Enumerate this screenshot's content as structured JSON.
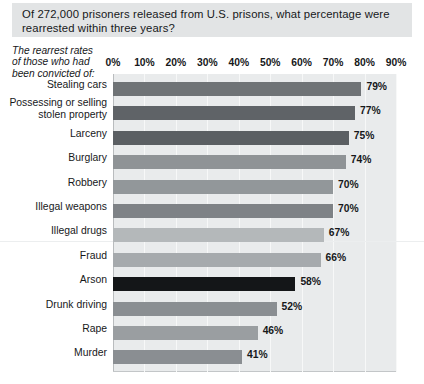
{
  "title": {
    "text": "Of 272,000 prisoners released from U.S. prisons, what percentage were\nrearrested within three years?"
  },
  "subtitle": {
    "text": "The rearrest rates\nof those who had\nbeen convicted of:"
  },
  "chart_data": {
    "type": "bar",
    "orientation": "horizontal",
    "title": "Of 272,000 prisoners released from U.S. prisons, what percentage were rearrested within three years?",
    "subtitle": "The rearrest rates of those who had been convicted of:",
    "xlabel": "",
    "ylabel": "",
    "xlim": [
      0,
      90
    ],
    "grid": true,
    "legend": false,
    "tick_labels": [
      "0%",
      "10%",
      "20%",
      "30%",
      "40%",
      "50%",
      "60%",
      "70%",
      "80%",
      "90%"
    ],
    "tick_values": [
      0,
      10,
      20,
      30,
      40,
      50,
      60,
      70,
      80,
      90
    ],
    "categories": [
      "Stealing cars",
      "Possessing or selling\nstolen property",
      "Larceny",
      "Burglary",
      "Robbery",
      "Illegal weapons",
      "Illegal drugs",
      "Fraud",
      "Arson",
      "Drunk driving",
      "Rape",
      "Murder"
    ],
    "values": [
      79,
      77,
      75,
      74,
      70,
      70,
      67,
      66,
      58,
      52,
      46,
      41
    ],
    "data_labels": [
      "79%",
      "77%",
      "75%",
      "74%",
      "70%",
      "70%",
      "67%",
      "66%",
      "58%",
      "52%",
      "46%",
      "41%"
    ],
    "bar_colors": [
      "#6f7376",
      "#5f6367",
      "#5b5f63",
      "#8f9396",
      "#92979a",
      "#7e8286",
      "#b4b8ba",
      "#a6aaad",
      "#141618",
      "#8a8e92",
      "#9a9ea1",
      "#8a8e92"
    ]
  },
  "colors": {
    "banner_background": "#e2e4e5",
    "plot_background": "#e9ebec",
    "gridline": "#f7f8f8",
    "text": "#16181a"
  }
}
